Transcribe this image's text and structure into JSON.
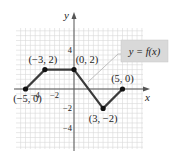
{
  "chart_data": {
    "type": "line",
    "title": "",
    "function_label": "y = f(x)",
    "xlabel": "x",
    "ylabel": "y",
    "x": [
      -5,
      -3,
      0,
      3,
      5
    ],
    "y": [
      0,
      2,
      2,
      -2,
      0
    ],
    "points": [
      {
        "x": -5,
        "y": 0,
        "label": "(−5, 0)"
      },
      {
        "x": -3,
        "y": 2,
        "label": "(−3, 2)"
      },
      {
        "x": 0,
        "y": 2,
        "label": "(0, 2)"
      },
      {
        "x": 3,
        "y": -2,
        "label": "(3, −2)"
      },
      {
        "x": 5,
        "y": 0,
        "label": "(5, 0)"
      }
    ],
    "x_ticks": [
      {
        "value": -4,
        "label": "−4"
      },
      {
        "value": -2,
        "label": "−2"
      }
    ],
    "y_ticks": [
      {
        "value": 4,
        "label": "4"
      },
      {
        "value": -2,
        "label": "−2"
      },
      {
        "value": -4,
        "label": "−4"
      }
    ],
    "xlim": [
      -6,
      7
    ],
    "ylim": [
      -6,
      6
    ],
    "grid": true,
    "grid_step": 0.5,
    "colors": {
      "line": "#3a3a3a",
      "grid": "#d8d8d8",
      "axis": "#555555",
      "label_box": "#d9d9d9",
      "leader": "#b0b0b0"
    }
  }
}
